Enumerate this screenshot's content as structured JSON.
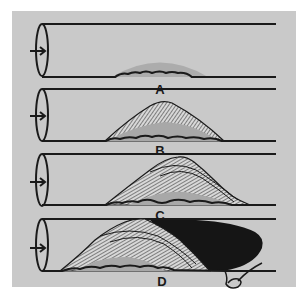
{
  "figure": {
    "colors": {
      "background": "#c9c9c9",
      "ink": "#1a1a1a",
      "fatty_streak": "#a8a8a8",
      "clot": "#151515"
    },
    "stages": [
      {
        "label": "A",
        "description": "fatty streak along vessel wall"
      },
      {
        "label": "B",
        "description": "fibrous plaque formation"
      },
      {
        "label": "C",
        "description": "enlarged layered plaque"
      },
      {
        "label": "D",
        "description": "plaque with occluding thrombus and detached fragment"
      }
    ],
    "flow_direction_icon": "arrow-right-icon"
  }
}
